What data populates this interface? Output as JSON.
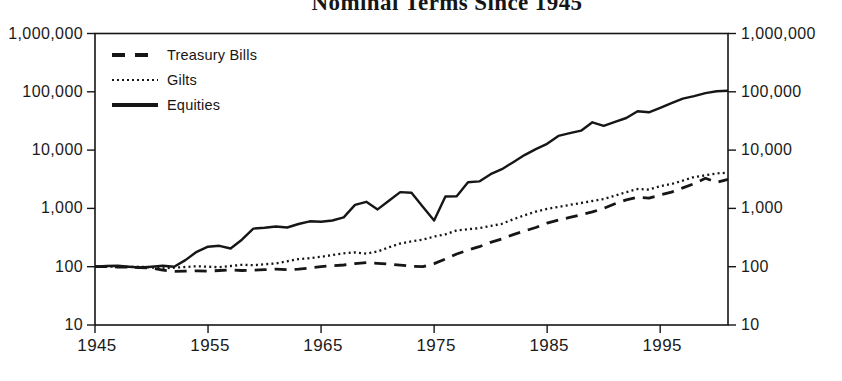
{
  "title": "Nominal Terms Since 1945",
  "legend": {
    "items": [
      {
        "label": "Treasury Bills",
        "style": "dashed"
      },
      {
        "label": "Gilts",
        "style": "dotted"
      },
      {
        "label": "Equities",
        "style": "solid"
      }
    ]
  },
  "axes": {
    "y_left_ticks": [
      "1,000,000",
      "100,000",
      "10,000",
      "1,000",
      "100",
      "10"
    ],
    "y_right_ticks": [
      "1,000,000",
      "100,000",
      "10,000",
      "1,000",
      "100",
      "10"
    ],
    "x_ticks": [
      "1945",
      "1955",
      "1965",
      "1975",
      "1985",
      "1995"
    ]
  },
  "colors": {
    "line": "#161616",
    "background": "#ffffff"
  },
  "chart_data": {
    "type": "line",
    "title": "Nominal Terms Since 1945",
    "y_scale": "log",
    "x_range": [
      1945,
      2001
    ],
    "y_range": [
      10,
      1000000
    ],
    "grid": false,
    "legend_position": "top-left-inside",
    "x": [
      1945,
      1946,
      1947,
      1948,
      1949,
      1950,
      1951,
      1952,
      1953,
      1954,
      1955,
      1956,
      1957,
      1958,
      1959,
      1960,
      1961,
      1962,
      1963,
      1964,
      1965,
      1966,
      1967,
      1968,
      1969,
      1970,
      1971,
      1972,
      1973,
      1974,
      1975,
      1976,
      1977,
      1978,
      1979,
      1980,
      1981,
      1982,
      1983,
      1984,
      1985,
      1986,
      1987,
      1988,
      1989,
      1990,
      1991,
      1992,
      1993,
      1994,
      1995,
      1996,
      1997,
      1998,
      1999,
      2000,
      2001
    ],
    "series": [
      {
        "name": "Treasury Bills",
        "line_style": "dashed",
        "values": [
          100,
          100,
          99,
          98,
          96,
          95,
          87,
          83,
          84,
          85,
          84,
          86,
          88,
          86,
          87,
          89,
          91,
          89,
          91,
          95,
          100,
          104,
          107,
          113,
          117,
          114,
          111,
          106,
          102,
          100,
          113,
          135,
          165,
          193,
          220,
          262,
          300,
          355,
          410,
          470,
          560,
          630,
          700,
          780,
          870,
          1000,
          1200,
          1400,
          1550,
          1500,
          1700,
          1900,
          2250,
          2650,
          3280,
          2800,
          3150
        ]
      },
      {
        "name": "Gilts",
        "line_style": "dotted",
        "values": [
          100,
          101,
          100,
          99,
          100,
          97,
          94,
          96,
          99,
          102,
          100,
          98,
          103,
          108,
          106,
          110,
          114,
          124,
          135,
          140,
          148,
          158,
          170,
          176,
          168,
          182,
          215,
          250,
          272,
          290,
          330,
          360,
          420,
          440,
          460,
          500,
          545,
          650,
          760,
          880,
          980,
          1060,
          1150,
          1240,
          1340,
          1450,
          1650,
          1900,
          2150,
          2100,
          2400,
          2620,
          3000,
          3450,
          3700,
          3990,
          4100
        ]
      },
      {
        "name": "Equities",
        "line_style": "solid",
        "values": [
          100,
          103,
          104,
          100,
          97,
          100,
          104,
          100,
          130,
          180,
          220,
          228,
          205,
          290,
          450,
          465,
          490,
          470,
          540,
          600,
          590,
          620,
          700,
          1150,
          1300,
          960,
          1350,
          1900,
          1850,
          1070,
          620,
          1600,
          1620,
          2800,
          2900,
          3860,
          4700,
          6200,
          8200,
          10400,
          12800,
          17500,
          19500,
          21500,
          30000,
          26000,
          30500,
          35500,
          46500,
          44500,
          53000,
          64000,
          76000,
          84000,
          95000,
          102000,
          104000
        ]
      }
    ]
  }
}
